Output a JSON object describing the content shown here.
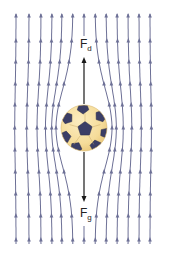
{
  "diagram": {
    "labels": {
      "drag_force": {
        "main": "F",
        "sub": "d"
      },
      "gravity_force": {
        "main": "F",
        "sub": "g"
      }
    },
    "colors": {
      "streamline": "#6d7096",
      "arrow_force": "#1a1a1a",
      "ball_fill": "#f5dc9a",
      "ball_shade": "#e9c77a",
      "ball_patch": "#3b3e66",
      "background": "#ffffff"
    },
    "ball": {
      "cx": 84,
      "cy": 128,
      "r": 23
    },
    "streamlines_x": [
      16,
      29,
      41,
      52,
      62,
      73,
      95,
      106,
      117,
      128,
      139,
      150
    ],
    "center_x": 84,
    "force_arrows": {
      "drag": {
        "from_y": 104,
        "to_y": 57
      },
      "gravity": {
        "from_y": 152,
        "to_y": 202
      }
    }
  }
}
